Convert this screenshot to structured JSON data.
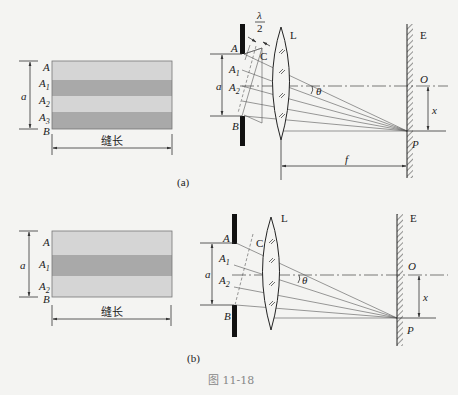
{
  "figure_caption": "图 11-18",
  "panel_a": {
    "label": "(a)",
    "slit_face": {
      "edge_top": "A",
      "edge_bottom": "B",
      "width_label": "a",
      "length_label": "缝长",
      "zones": [
        "A",
        "A1",
        "A2",
        "A3"
      ],
      "zone_count": 4,
      "colors": {
        "light": "#d3d3d3",
        "dark": "#a8a8a8"
      }
    },
    "setup": {
      "half_wavelength_label": "λ/2",
      "wavefront_label": "C",
      "lens_label": "L",
      "screen_label": "E",
      "center_label": "O",
      "point_label": "P",
      "angle_label": "θ",
      "focal_label": "f",
      "offset_label": "x",
      "slit_points": [
        "A",
        "A1",
        "A2",
        "B"
      ],
      "slit_width_label": "a"
    }
  },
  "panel_b": {
    "label": "(b)",
    "slit_face": {
      "edge_top": "A",
      "edge_bottom": "B",
      "width_label": "a",
      "length_label": "缝长",
      "zones": [
        "A",
        "A1",
        "A2"
      ],
      "zone_count": 3,
      "colors": {
        "light": "#d3d3d3",
        "dark": "#a8a8a8"
      }
    },
    "setup": {
      "wavefront_label": "C",
      "lens_label": "L",
      "screen_label": "E",
      "center_label": "O",
      "point_label": "P",
      "angle_label": "θ",
      "offset_label": "x",
      "slit_points": [
        "A",
        "A1",
        "A2",
        "B"
      ],
      "slit_width_label": "a"
    }
  }
}
